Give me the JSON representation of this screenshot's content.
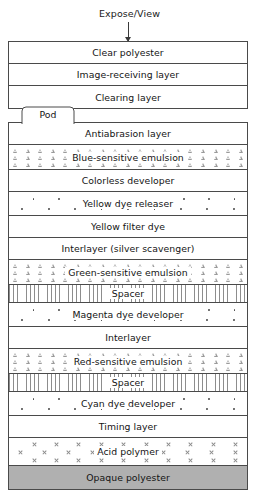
{
  "diagram": {
    "annotation": {
      "expose_label": "Expose/View",
      "arrow_icon": "down-arrow-icon"
    },
    "pod": {
      "label": "Pod"
    },
    "top_stack": [
      {
        "label": "Clear polyester",
        "texture": "none"
      },
      {
        "label": "Image-receiving layer",
        "texture": "none"
      },
      {
        "label": "Clearing layer",
        "texture": "none"
      }
    ],
    "main_stack": [
      {
        "label": "Antiabrasion layer",
        "texture": "none"
      },
      {
        "label": "Blue-sensitive emulsion",
        "texture": "triangles"
      },
      {
        "label": "Colorless developer",
        "texture": "none"
      },
      {
        "label": "Yellow dye releaser",
        "texture": "dots"
      },
      {
        "label": "Yellow filter dye",
        "texture": "none"
      },
      {
        "label": "Interlayer (silver scavenger)",
        "texture": "none"
      },
      {
        "label": "Green-sensitive emulsion",
        "texture": "triangles"
      },
      {
        "label": "Spacer",
        "texture": "hatch"
      },
      {
        "label": "Magenta dye developer",
        "texture": "dots"
      },
      {
        "label": "Interlayer",
        "texture": "none"
      },
      {
        "label": "Red-sensitive emulsion",
        "texture": "triangles"
      },
      {
        "label": "Spacer",
        "texture": "hatch"
      },
      {
        "label": "Cyan dye developer",
        "texture": "dots"
      },
      {
        "label": "Timing layer",
        "texture": "none"
      },
      {
        "label": "Acid polymer",
        "texture": "crosses"
      },
      {
        "label": "Opaque polyester",
        "texture": "solid-gray"
      }
    ],
    "colors": {
      "stroke": "#4a4a4a",
      "text": "#141414",
      "opaque_fill": "#b0b0b0",
      "texture_gray": "#9a9a9a",
      "background": "#ffffff"
    }
  }
}
